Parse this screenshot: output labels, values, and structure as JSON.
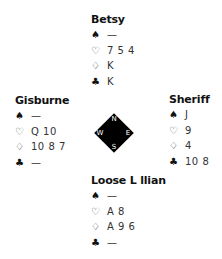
{
  "suits": {
    "spades": {
      "glyph": "♠",
      "name": "spades-icon",
      "style": "black"
    },
    "hearts": {
      "glyph": "♡",
      "name": "hearts-icon",
      "style": "outline"
    },
    "diamonds": {
      "glyph": "♢",
      "name": "diamonds-icon",
      "style": "outline"
    },
    "clubs": {
      "glyph": "♣",
      "name": "clubs-icon",
      "style": "black"
    }
  },
  "hands": {
    "north": {
      "player": "Betsy",
      "spades": "—",
      "hearts": "7 5 4",
      "diamonds": "K",
      "clubs": "K"
    },
    "west": {
      "player": "Gisburne",
      "spades": "—",
      "hearts": "Q 10",
      "diamonds": "10 8 7",
      "clubs": "—"
    },
    "east": {
      "player": "Sheriff",
      "spades": "J",
      "hearts": "9",
      "diamonds": "4",
      "clubs": "10 8"
    },
    "south": {
      "player": "Loose L llian",
      "spades": "—",
      "hearts": "A 8",
      "diamonds": "A 9 6",
      "clubs": "—"
    }
  },
  "compass": {
    "n": "N",
    "s": "S",
    "e": "E",
    "w": "W"
  }
}
